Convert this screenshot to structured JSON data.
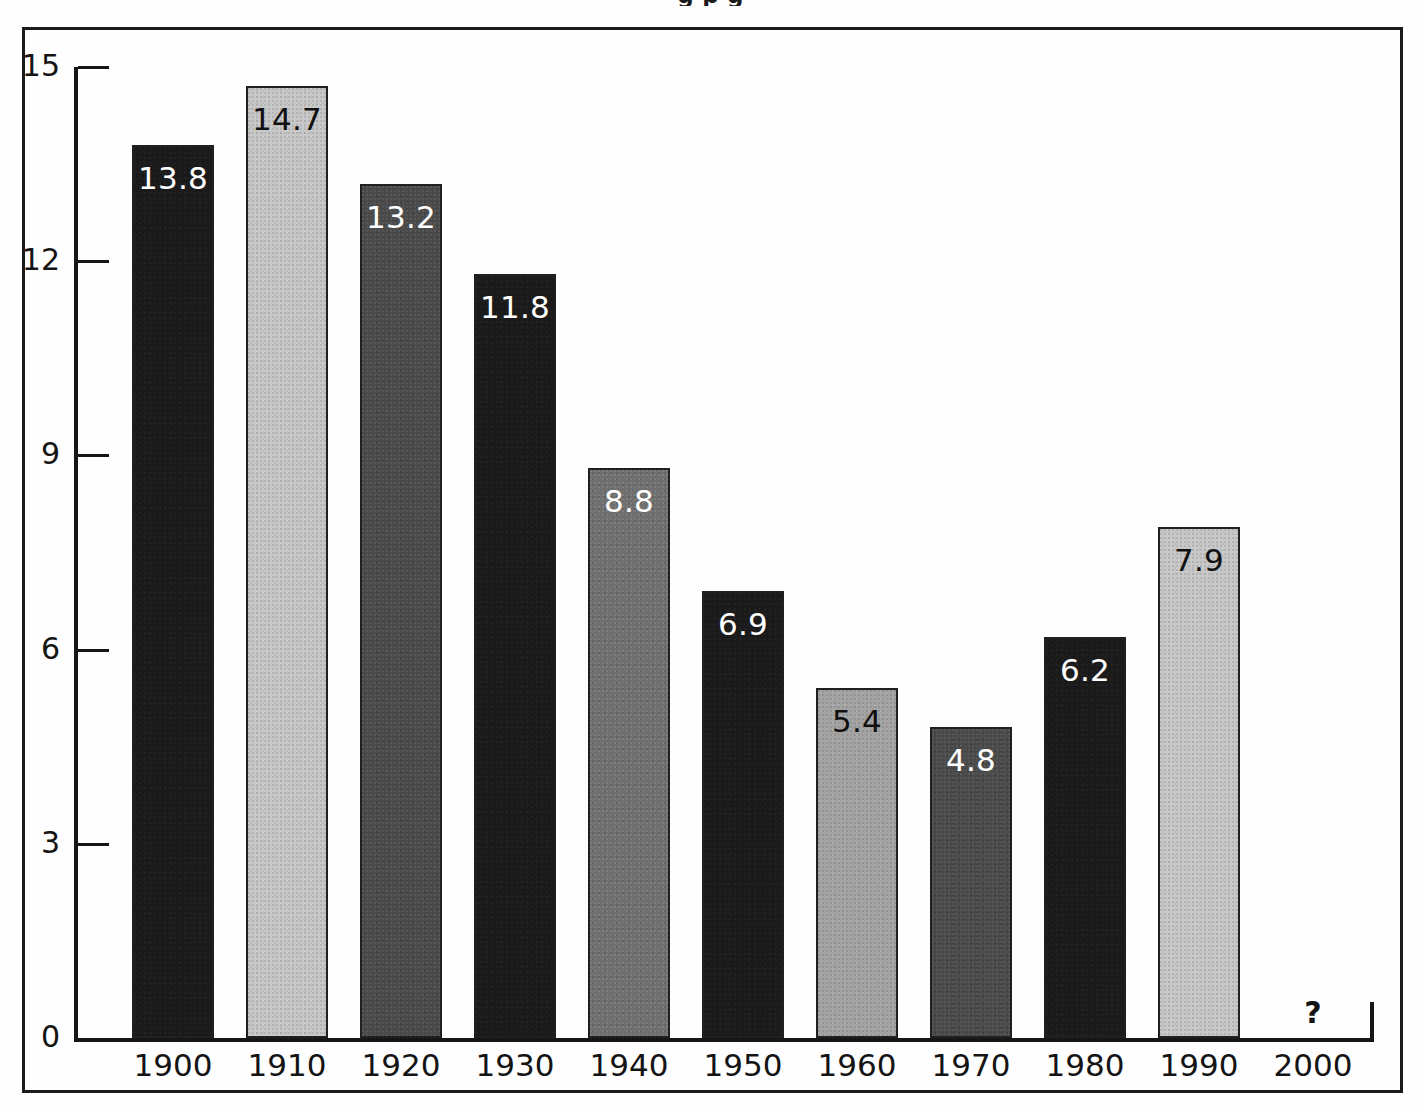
{
  "page": {
    "title_partial": "g         p                    g",
    "background": "#fefefe",
    "frame_color": "#1b1b1b"
  },
  "axes": {
    "y_ticks": [
      "15",
      "12",
      "9",
      "6",
      "3",
      "0"
    ],
    "x_labels": [
      "1900",
      "1910",
      "1920",
      "1930",
      "1940",
      "1950",
      "1960",
      "1970",
      "1980",
      "1990",
      "2000"
    ],
    "missing_value_marker": "?",
    "axis_color": "#161616"
  },
  "chart_data": {
    "type": "bar",
    "title": "",
    "xlabel": "",
    "ylabel": "",
    "ylim": [
      0,
      15
    ],
    "y_ticks": [
      0,
      3,
      6,
      9,
      12,
      15
    ],
    "grid": false,
    "legend": null,
    "categories": [
      "1900",
      "1910",
      "1920",
      "1930",
      "1940",
      "1950",
      "1960",
      "1970",
      "1980",
      "1990",
      "2000"
    ],
    "values": [
      13.8,
      14.7,
      13.2,
      11.8,
      8.8,
      6.9,
      5.4,
      4.8,
      6.2,
      7.9,
      null
    ],
    "data_labels": [
      "13.8",
      "14.7",
      "13.2",
      "11.8",
      "8.8",
      "6.9",
      "5.4",
      "4.8",
      "6.2",
      "7.9",
      "?"
    ],
    "bar_styles": [
      {
        "category": "1900",
        "label": "13.8",
        "value": 13.8,
        "fill": "#1a1a1a",
        "texture": "tex-black",
        "label_color": "light"
      },
      {
        "category": "1910",
        "label": "14.7",
        "value": 14.7,
        "fill": "#c8c8c8",
        "texture": "tex-light",
        "label_color": "dark"
      },
      {
        "category": "1920",
        "label": "13.2",
        "value": 13.2,
        "fill": "#4a4a4a",
        "texture": "tex-darkgray",
        "label_color": "light"
      },
      {
        "category": "1930",
        "label": "11.8",
        "value": 11.8,
        "fill": "#2a2a2a",
        "texture": "tex-black",
        "label_color": "light"
      },
      {
        "category": "1940",
        "label": "8.8",
        "value": 8.8,
        "fill": "#6f6f6f",
        "texture": "tex-midgray",
        "label_color": "light"
      },
      {
        "category": "1950",
        "label": "6.9",
        "value": 6.9,
        "fill": "#1a1a1a",
        "texture": "tex-black",
        "label_color": "light"
      },
      {
        "category": "1960",
        "label": "5.4",
        "value": 5.4,
        "fill": "#a3a3a3",
        "texture": "tex-midlight",
        "label_color": "dark"
      },
      {
        "category": "1970",
        "label": "4.8",
        "value": 4.8,
        "fill": "#4a4a4a",
        "texture": "tex-darkgray",
        "label_color": "light"
      },
      {
        "category": "1980",
        "label": "6.2",
        "value": 6.2,
        "fill": "#1a1a1a",
        "texture": "tex-black",
        "label_color": "light"
      },
      {
        "category": "1990",
        "label": "7.9",
        "value": 7.9,
        "fill": "#c8c8c8",
        "texture": "tex-light",
        "label_color": "dark"
      },
      {
        "category": "2000",
        "label": "?",
        "value": null,
        "fill": null,
        "texture": null,
        "label_color": "dark"
      }
    ]
  },
  "geometry": {
    "baseline_y": 1038,
    "top_y": 67,
    "axis_x": 74,
    "bar_start_x": 132,
    "bar_width": 82,
    "bar_pitch": 114
  }
}
